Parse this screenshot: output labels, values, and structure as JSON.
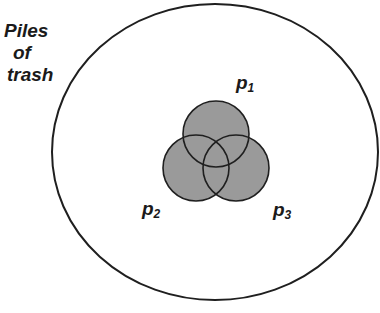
{
  "region": {
    "label_lines": [
      "Piles",
      "of",
      "trash"
    ],
    "shape": "ellipse",
    "stroke": "#1f1f1f",
    "fill": "#ffffff"
  },
  "sets": [
    {
      "name": "p",
      "subscript": "1",
      "position": "top"
    },
    {
      "name": "p",
      "subscript": "2",
      "position": "bottom-left"
    },
    {
      "name": "p",
      "subscript": "3",
      "position": "bottom-right"
    }
  ],
  "colors": {
    "set_fill": "#9a9a9a",
    "set_stroke": "#1f1f1f"
  }
}
